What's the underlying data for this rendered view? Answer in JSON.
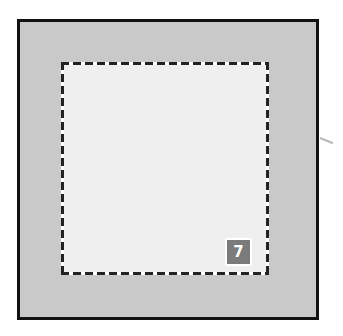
{
  "diagram": {
    "outer_frame": {
      "fill": "#c9c9c9",
      "border": "#111111"
    },
    "inner_region": {
      "fill": "#efefef",
      "border_style": "dashed"
    },
    "badge": {
      "label": "7",
      "fill": "#7b7b7b",
      "text_color": "#ffffff"
    }
  }
}
